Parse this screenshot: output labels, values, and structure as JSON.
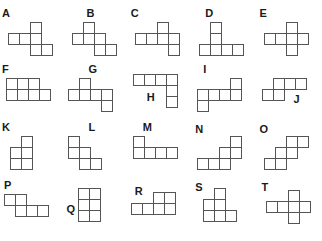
{
  "page": {
    "background_color": "#ffffff",
    "outline_color": "#555555",
    "label_color": "#1a1a1a",
    "cell_size_px": 12,
    "columns": 5,
    "rows": 4,
    "total_shapes": 20
  },
  "shapes": [
    {
      "id": "A",
      "label": "A",
      "label_pos": {
        "x": 2,
        "y": 2
      },
      "origin": {
        "x": 8,
        "y": 16
      },
      "cells": [
        [
          2,
          0
        ],
        [
          0,
          1
        ],
        [
          1,
          1
        ],
        [
          2,
          1
        ],
        [
          2,
          2
        ],
        [
          3,
          2
        ]
      ],
      "cell_count": 6
    },
    {
      "id": "B",
      "label": "B",
      "label_pos": {
        "x": 22,
        "y": 2
      },
      "origin": {
        "x": 8,
        "y": 16
      },
      "cells": [
        [
          1,
          0
        ],
        [
          0,
          1
        ],
        [
          1,
          1
        ],
        [
          2,
          1
        ],
        [
          2,
          2
        ],
        [
          3,
          2
        ]
      ],
      "cell_count": 6
    },
    {
      "id": "C",
      "label": "C",
      "label_pos": {
        "x": 2,
        "y": 2
      },
      "origin": {
        "x": 6,
        "y": 16
      },
      "cells": [
        [
          2,
          0
        ],
        [
          0,
          1
        ],
        [
          1,
          1
        ],
        [
          2,
          1
        ],
        [
          3,
          1
        ],
        [
          3,
          2
        ]
      ],
      "cell_count": 6
    },
    {
      "id": "D",
      "label": "D",
      "label_pos": {
        "x": 12,
        "y": 2
      },
      "origin": {
        "x": 6,
        "y": 16
      },
      "cells": [
        [
          1,
          0
        ],
        [
          1,
          1
        ],
        [
          0,
          2
        ],
        [
          1,
          2
        ],
        [
          2,
          2
        ],
        [
          3,
          2
        ]
      ],
      "cell_count": 6
    },
    {
      "id": "E",
      "label": "E",
      "label_pos": {
        "x": 2,
        "y": 2
      },
      "origin": {
        "x": 6,
        "y": 16
      },
      "cells": [
        [
          2,
          0
        ],
        [
          0,
          1
        ],
        [
          1,
          1
        ],
        [
          2,
          1
        ],
        [
          3,
          1
        ],
        [
          2,
          2
        ]
      ],
      "cell_count": 6
    },
    {
      "id": "F",
      "label": "F",
      "label_pos": {
        "x": 2,
        "y": 0
      },
      "origin": {
        "x": 6,
        "y": 14
      },
      "cells": [
        [
          0,
          0
        ],
        [
          1,
          0
        ],
        [
          2,
          0
        ],
        [
          0,
          1
        ],
        [
          1,
          1
        ],
        [
          2,
          1
        ],
        [
          3,
          1
        ]
      ],
      "cell_count": 7
    },
    {
      "id": "G",
      "label": "G",
      "label_pos": {
        "x": 24,
        "y": 0
      },
      "origin": {
        "x": 4,
        "y": 14
      },
      "cells": [
        [
          1,
          0
        ],
        [
          0,
          1
        ],
        [
          1,
          1
        ],
        [
          2,
          1
        ],
        [
          3,
          1
        ],
        [
          3,
          2
        ]
      ],
      "cell_count": 6
    },
    {
      "id": "H",
      "label": "H",
      "label_pos": {
        "x": 18,
        "y": 28
      },
      "origin": {
        "x": 4,
        "y": 10
      },
      "cells": [
        [
          0,
          0
        ],
        [
          1,
          0
        ],
        [
          2,
          0
        ],
        [
          3,
          0
        ],
        [
          3,
          1
        ],
        [
          3,
          2
        ]
      ],
      "cell_count": 6
    },
    {
      "id": "I",
      "label": "I",
      "label_pos": {
        "x": 10,
        "y": 0
      },
      "origin": {
        "x": 4,
        "y": 14
      },
      "cells": [
        [
          3,
          0
        ],
        [
          0,
          1
        ],
        [
          1,
          1
        ],
        [
          2,
          1
        ],
        [
          3,
          1
        ],
        [
          0,
          2
        ]
      ],
      "cell_count": 6
    },
    {
      "id": "J",
      "label": "J",
      "label_pos": {
        "x": 36,
        "y": 30
      },
      "origin": {
        "x": 4,
        "y": 14
      },
      "cells": [
        [
          1,
          0
        ],
        [
          2,
          0
        ],
        [
          3,
          0
        ],
        [
          0,
          1
        ],
        [
          1,
          1
        ]
      ],
      "cell_count": 5
    },
    {
      "id": "K",
      "label": "K",
      "label_pos": {
        "x": 2,
        "y": 0
      },
      "origin": {
        "x": 10,
        "y": 14
      },
      "cells": [
        [
          1,
          0
        ],
        [
          0,
          1
        ],
        [
          1,
          1
        ],
        [
          0,
          2
        ],
        [
          1,
          2
        ]
      ],
      "cell_count": 5
    },
    {
      "id": "L",
      "label": "L",
      "label_pos": {
        "x": 24,
        "y": 0
      },
      "origin": {
        "x": 4,
        "y": 14
      },
      "cells": [
        [
          0,
          0
        ],
        [
          0,
          1
        ],
        [
          1,
          1
        ],
        [
          1,
          2
        ],
        [
          2,
          2
        ]
      ],
      "cell_count": 5
    },
    {
      "id": "M",
      "label": "M",
      "label_pos": {
        "x": 14,
        "y": 0
      },
      "origin": {
        "x": 4,
        "y": 14
      },
      "cells": [
        [
          0,
          0
        ],
        [
          0,
          1
        ],
        [
          1,
          1
        ],
        [
          2,
          1
        ],
        [
          3,
          1
        ]
      ],
      "cell_count": 5
    },
    {
      "id": "N",
      "label": "N",
      "label_pos": {
        "x": 2,
        "y": 2
      },
      "origin": {
        "x": 4,
        "y": 14
      },
      "cells": [
        [
          3,
          0
        ],
        [
          2,
          1
        ],
        [
          3,
          1
        ],
        [
          0,
          2
        ],
        [
          1,
          2
        ],
        [
          2,
          2
        ]
      ],
      "cell_count": 6
    },
    {
      "id": "O",
      "label": "O",
      "label_pos": {
        "x": 2,
        "y": 2
      },
      "origin": {
        "x": 6,
        "y": 14
      },
      "cells": [
        [
          2,
          0
        ],
        [
          3,
          0
        ],
        [
          1,
          1
        ],
        [
          2,
          1
        ],
        [
          0,
          2
        ],
        [
          1,
          2
        ]
      ],
      "cell_count": 6
    },
    {
      "id": "P",
      "label": "P",
      "label_pos": {
        "x": 4,
        "y": 0
      },
      "origin": {
        "x": 4,
        "y": 14
      },
      "cells": [
        [
          0,
          0
        ],
        [
          1,
          0
        ],
        [
          1,
          1
        ],
        [
          2,
          1
        ],
        [
          3,
          1
        ]
      ],
      "cell_count": 5
    },
    {
      "id": "Q",
      "label": "Q",
      "label_pos": {
        "x": 2,
        "y": 24
      },
      "origin": {
        "x": 14,
        "y": 8
      },
      "cells": [
        [
          0,
          0
        ],
        [
          1,
          0
        ],
        [
          0,
          1
        ],
        [
          1,
          1
        ],
        [
          0,
          2
        ],
        [
          1,
          2
        ]
      ],
      "cell_count": 6
    },
    {
      "id": "R",
      "label": "R",
      "label_pos": {
        "x": 6,
        "y": 6
      },
      "origin": {
        "x": 2,
        "y": 12
      },
      "cells": [
        [
          2,
          0
        ],
        [
          3,
          0
        ],
        [
          0,
          1
        ],
        [
          1,
          1
        ],
        [
          2,
          1
        ],
        [
          3,
          1
        ]
      ],
      "cell_count": 6
    },
    {
      "id": "S",
      "label": "S",
      "label_pos": {
        "x": 2,
        "y": 2
      },
      "origin": {
        "x": 10,
        "y": 8
      },
      "cells": [
        [
          1,
          0
        ],
        [
          0,
          1
        ],
        [
          1,
          1
        ],
        [
          0,
          2
        ],
        [
          1,
          2
        ],
        [
          2,
          2
        ]
      ],
      "cell_count": 6
    },
    {
      "id": "T",
      "label": "T",
      "label_pos": {
        "x": 4,
        "y": 2
      },
      "origin": {
        "x": 8,
        "y": 10
      },
      "cells": [
        [
          2,
          0
        ],
        [
          0,
          1
        ],
        [
          1,
          1
        ],
        [
          2,
          1
        ],
        [
          3,
          1
        ],
        [
          2,
          2
        ]
      ],
      "cell_count": 6
    }
  ]
}
